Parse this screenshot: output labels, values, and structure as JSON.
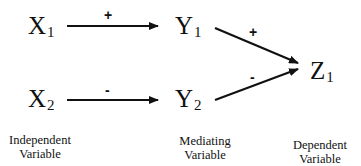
{
  "nodes": {
    "x1": {
      "letter": "X",
      "sub": "1"
    },
    "x2": {
      "letter": "X",
      "sub": "2"
    },
    "y1": {
      "letter": "Y",
      "sub": "1"
    },
    "y2": {
      "letter": "Y",
      "sub": "2"
    },
    "z1": {
      "letter": "Z",
      "sub": "1"
    }
  },
  "edges": [
    {
      "from": "X1",
      "to": "Y1",
      "sign": "+"
    },
    {
      "from": "X2",
      "to": "Y2",
      "sign": "-"
    },
    {
      "from": "Y1",
      "to": "Z1",
      "sign": "+"
    },
    {
      "from": "Y2",
      "to": "Z1",
      "sign": "-"
    }
  ],
  "labels": {
    "independent": {
      "line1": "Independent",
      "line2": "Variable"
    },
    "mediating": {
      "line1": "Mediating",
      "line2": "Variable"
    },
    "dependent": {
      "line1": "Dependent",
      "line2": "Variable"
    }
  },
  "colors": {
    "line": "#111111",
    "background": "#ffffff"
  }
}
